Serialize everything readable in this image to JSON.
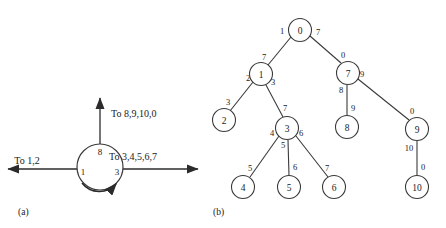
{
  "figure": {
    "panels": [
      {
        "id": "a",
        "caption": "(a)",
        "caption_x": 18,
        "caption_y": 212
      },
      {
        "id": "b",
        "caption": "(b)",
        "caption_x": 213,
        "caption_y": 212
      }
    ]
  },
  "ring": {
    "center_x": 100,
    "center_y": 167,
    "radius": 23,
    "ports": [
      {
        "name": "port-left",
        "label": "1",
        "x": 83,
        "y": 172
      },
      {
        "name": "port-right",
        "label": "3",
        "x": 117,
        "y": 172
      },
      {
        "name": "port-top",
        "label": "8",
        "x": 100,
        "y": 152
      }
    ],
    "arrows": [
      {
        "name": "arrow-left",
        "label": "To  1,2",
        "label_x": 27,
        "label_y": 160,
        "x1": 77,
        "y1": 169,
        "x2": 8,
        "y2": 169
      },
      {
        "name": "arrow-right",
        "label": "To  3,4,5,6,7",
        "label_x": 133,
        "label_y": 156,
        "x1": 123,
        "y1": 169,
        "x2": 198,
        "y2": 169
      },
      {
        "name": "arrow-top",
        "label": "To  8,9,10,0",
        "label_x": 111,
        "label_y": 113,
        "x1": 100,
        "y1": 144,
        "x2": 100,
        "y2": 98
      }
    ],
    "rotation_arc": {
      "name": "rotation-arrow",
      "path": "M 82 183 A 22 22 0 0 0 116 184"
    }
  },
  "tree": {
    "nodes": [
      {
        "id": "n0",
        "label": "0",
        "x": 300,
        "y": 30,
        "r": 11.5
      },
      {
        "id": "n1",
        "label": "1",
        "x": 261,
        "y": 74,
        "r": 11.5
      },
      {
        "id": "n7",
        "label": "7",
        "x": 348,
        "y": 73,
        "r": 11.5
      },
      {
        "id": "n2",
        "label": "2",
        "x": 224,
        "y": 120,
        "r": 11.5
      },
      {
        "id": "n3",
        "label": "3",
        "x": 287,
        "y": 128,
        "r": 11.5
      },
      {
        "id": "n8",
        "label": "8",
        "x": 347,
        "y": 127,
        "r": 11.5
      },
      {
        "id": "n9",
        "label": "9",
        "x": 417,
        "y": 129,
        "r": 11.5
      },
      {
        "id": "n4",
        "label": "4",
        "x": 243,
        "y": 187,
        "r": 11.5
      },
      {
        "id": "n5",
        "label": "5",
        "x": 289,
        "y": 187,
        "r": 11.5
      },
      {
        "id": "n6",
        "label": "6",
        "x": 334,
        "y": 187,
        "r": 11.5
      },
      {
        "id": "n10",
        "label": "10",
        "x": 417,
        "y": 187,
        "r": 11.5
      }
    ],
    "edges": [
      {
        "id": "e0-1",
        "from": "n0",
        "to": "n1",
        "x1": 291,
        "y1": 37,
        "x2": 268,
        "y2": 65,
        "labels": [
          {
            "text": "1",
            "x": 282,
            "y": 31
          },
          {
            "text": "7",
            "x": 264,
            "y": 57
          }
        ]
      },
      {
        "id": "e0-7",
        "from": "n0",
        "to": "n7",
        "x1": 310,
        "y1": 36,
        "x2": 341,
        "y2": 63,
        "labels": [
          {
            "text": "7",
            "x": 318,
            "y": 32
          },
          {
            "text": "0",
            "x": 343,
            "y": 55
          }
        ]
      },
      {
        "id": "e1-2",
        "from": "n1",
        "to": "n2",
        "x1": 253,
        "y1": 82,
        "x2": 230,
        "y2": 111,
        "labels": [
          {
            "text": "2",
            "x": 248,
            "y": 78
          },
          {
            "text": "3",
            "x": 228,
            "y": 102
          }
        ]
      },
      {
        "id": "e1-3",
        "from": "n1",
        "to": "n3",
        "x1": 266,
        "y1": 85,
        "x2": 283,
        "y2": 117,
        "labels": [
          {
            "text": "3",
            "x": 273,
            "y": 82
          },
          {
            "text": "7",
            "x": 285,
            "y": 108
          }
        ]
      },
      {
        "id": "e7-8",
        "from": "n7",
        "to": "n8",
        "x1": 347,
        "y1": 85,
        "x2": 347,
        "y2": 115,
        "labels": [
          {
            "text": "8",
            "x": 341,
            "y": 90
          },
          {
            "text": "9",
            "x": 353,
            "y": 108
          }
        ]
      },
      {
        "id": "e7-9",
        "from": "n7",
        "to": "n9",
        "x1": 358,
        "y1": 79,
        "x2": 409,
        "y2": 120,
        "labels": [
          {
            "text": "9",
            "x": 362,
            "y": 74
          },
          {
            "text": "0",
            "x": 412,
            "y": 111
          }
        ]
      },
      {
        "id": "e3-4",
        "from": "n3",
        "to": "n4",
        "x1": 279,
        "y1": 136,
        "x2": 250,
        "y2": 177,
        "labels": [
          {
            "text": "4",
            "x": 272,
            "y": 133
          },
          {
            "text": "5",
            "x": 250,
            "y": 168
          }
        ]
      },
      {
        "id": "e3-5",
        "from": "n3",
        "to": "n5",
        "x1": 288,
        "y1": 140,
        "x2": 289,
        "y2": 176,
        "labels": [
          {
            "text": "5",
            "x": 283,
            "y": 145
          },
          {
            "text": "6",
            "x": 295,
            "y": 167
          }
        ]
      },
      {
        "id": "e3-6",
        "from": "n3",
        "to": "n6",
        "x1": 296,
        "y1": 136,
        "x2": 328,
        "y2": 177,
        "labels": [
          {
            "text": "6",
            "x": 301,
            "y": 133
          },
          {
            "text": "7",
            "x": 327,
            "y": 168
          }
        ]
      },
      {
        "id": "e9-10",
        "from": "n9",
        "to": "n10",
        "x1": 417,
        "y1": 141,
        "x2": 417,
        "y2": 176,
        "labels": [
          {
            "text": "10",
            "x": 409,
            "y": 148
          },
          {
            "text": "0",
            "x": 423,
            "y": 167
          }
        ]
      }
    ]
  },
  "colors": {
    "ink": "#1a1a1a",
    "stroke": "#3a3a3a",
    "background": "#ffffff"
  }
}
